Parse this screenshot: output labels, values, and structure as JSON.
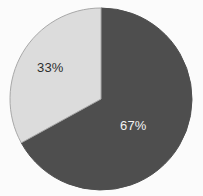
{
  "chart_data": {
    "type": "pie",
    "title": "",
    "subtitle": "",
    "xlabel": "",
    "ylabel": "",
    "legend": "none",
    "grid": false,
    "labels_shown": true,
    "label_format": "percent",
    "start_angle_deg": 0,
    "direction": "clockwise",
    "categories": [
      "67%",
      "33%"
    ],
    "values": [
      67,
      33
    ],
    "slices": [
      {
        "label": "67%",
        "value": 67,
        "color": "#4e4e4e",
        "stroke": "#4e4e4e",
        "label_color": "#f2f2f2",
        "start_angle_deg": 0,
        "end_angle_deg": 241.2
      },
      {
        "label": "33%",
        "value": 33,
        "color": "#dcdcdc",
        "stroke": "#a8a8a8",
        "label_color": "#2e2e2e",
        "start_angle_deg": 241.2,
        "end_angle_deg": 360
      }
    ],
    "annotations": []
  },
  "figure": {
    "background": "#fbfbfb",
    "center_x": 101,
    "center_y": 99,
    "radius": 91
  }
}
